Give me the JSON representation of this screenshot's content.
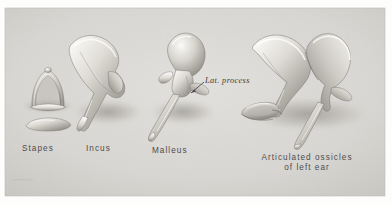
{
  "figure": {
    "kind": "anatomical-illustration-plate",
    "background_color": "#d9d7d3",
    "page_color": "#fdfdfc",
    "label_color": "#49484a",
    "bone_light": "#f2f0ec",
    "bone_mid": "#c3c0ba",
    "bone_dark": "#8e8b85"
  },
  "labels": {
    "stapes": "Stapes",
    "incus": "Incus",
    "malleus": "Malleus",
    "articulated_line1": "Articulated ossicles",
    "articulated_line2": "of left ear"
  },
  "annotations": {
    "lat_process": "Lat. process"
  },
  "signature": {
    "text": "••••••••"
  },
  "specimens": [
    {
      "name": "stapes",
      "label": "Stapes",
      "parts": [
        "arch",
        "footplate"
      ]
    },
    {
      "name": "incus",
      "label": "Incus",
      "parts": [
        "body",
        "short-process",
        "long-process"
      ]
    },
    {
      "name": "malleus",
      "label": "Malleus",
      "parts": [
        "head",
        "neck",
        "lateral-process",
        "manubrium"
      ]
    },
    {
      "name": "articulated-ossicles",
      "label": "Articulated ossicles of left ear",
      "parts": [
        "incus",
        "malleus",
        "stapes"
      ]
    }
  ]
}
